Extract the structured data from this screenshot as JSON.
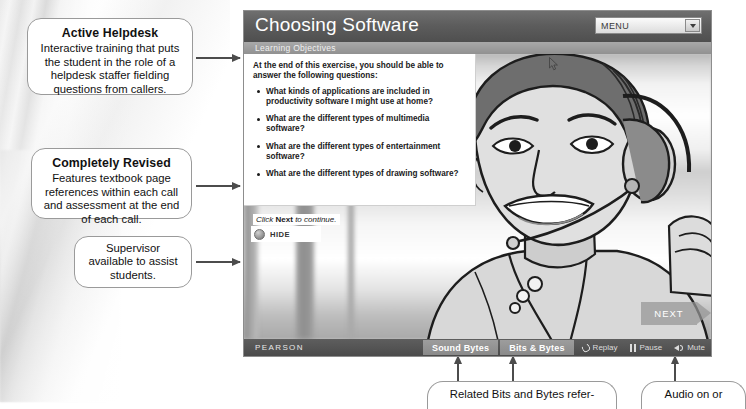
{
  "callouts": {
    "active_helpdesk": {
      "title": "Active Helpdesk",
      "body": "Interactive training that puts the student in the role of a helpdesk staffer fielding questions from callers."
    },
    "completely_revised": {
      "title": "Completely Revised",
      "body": "Features textbook page references within each call and assessment at the end of each call."
    },
    "supervisor": {
      "body": "Supervisor available to assist students."
    },
    "bits_and_bytes": {
      "body": "Related Bits and Bytes refer-"
    },
    "audio": {
      "body": "Audio on or"
    }
  },
  "app": {
    "title": "Choosing Software",
    "subtitle": "Learning Objectives",
    "menu": {
      "label": "MENU",
      "arrow_icon": "chevron-down-icon"
    },
    "objectives": {
      "intro": "At the end of this exercise, you should be able to answer the following questions:",
      "items": [
        "What kinds of applications are included in productivity software I might use at home?",
        "What are the different types of multimedia software?",
        "What are the different types of entertainment software?",
        "What are the different types of drawing software?"
      ]
    },
    "continue_hint": {
      "prefix": "Click ",
      "strong": "Next",
      "suffix": " to continue."
    },
    "hide_button": {
      "label": "HIDE",
      "icon": "collapse-circle-icon"
    },
    "next_button": {
      "label": "NEXT"
    },
    "footer": {
      "brand": "PEARSON",
      "sound_bytes": "Sound Bytes",
      "bits_bytes": "Bits & Bytes",
      "replay": "Replay",
      "pause": "Pause",
      "mute": "Mute"
    }
  },
  "colors": {
    "header_dark": "#5d5d5d",
    "subheader_grey": "#9b9b9b",
    "footer_dark": "#4f4f4f",
    "button_grey": "#949494",
    "arrow_grey": "#4c4c4c"
  }
}
